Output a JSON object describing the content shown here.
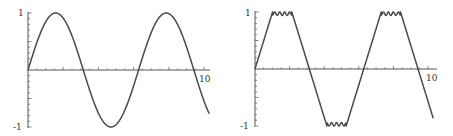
{
  "chart_data": [
    {
      "type": "line",
      "title": "",
      "xlabel": "",
      "ylabel": "",
      "function": "sin(x)",
      "x_range": [
        0,
        10.3
      ],
      "ylim": [
        -1,
        1
      ],
      "x_tick_labels": [
        "10"
      ],
      "y_tick_labels": [
        "1",
        "-1"
      ],
      "grid": false,
      "series": [
        {
          "name": "sin(x)",
          "x": [
            0,
            0.5,
            1,
            1.57,
            2,
            2.5,
            3,
            3.14,
            3.5,
            4,
            4.71,
            5,
            5.5,
            6,
            6.28,
            6.5,
            7,
            7.85,
            8.5,
            9,
            9.42,
            10,
            10.3
          ],
          "y": [
            0,
            0.48,
            0.84,
            1,
            0.91,
            0.6,
            0.14,
            0,
            -0.35,
            -0.76,
            -1,
            -0.96,
            -0.71,
            -0.28,
            0,
            0.22,
            0.66,
            1,
            0.8,
            0.41,
            0,
            -0.54,
            -0.77
          ]
        }
      ]
    },
    {
      "type": "line",
      "title": "",
      "xlabel": "",
      "ylabel": "",
      "function": "clipped triangle-like wave with ripple (Fourier approximation)",
      "x_range": [
        0,
        10.3
      ],
      "ylim": [
        -1,
        1
      ],
      "x_tick_labels": [
        "10"
      ],
      "y_tick_labels": [
        "1",
        "-1"
      ],
      "grid": false,
      "series": [
        {
          "name": "rippled trapezoid wave",
          "x": [
            0,
            0.8,
            1.0,
            2.2,
            2.4,
            3.14,
            3.9,
            4.1,
            5.3,
            5.5,
            6.28,
            7.1,
            7.3,
            8.5,
            8.7,
            9.42,
            10.3
          ],
          "y": [
            0,
            0.92,
            1,
            1,
            0.92,
            0,
            -0.92,
            -1,
            -1,
            -0.92,
            0,
            0.92,
            1,
            1,
            0.92,
            0,
            -1.35
          ]
        }
      ]
    }
  ],
  "panels": [
    {
      "x_label_max": "10",
      "y_label_top": "1",
      "y_label_bottom": "-1"
    },
    {
      "x_label_max": "10",
      "y_label_top": "1",
      "y_label_bottom": "-1"
    }
  ],
  "colors": {
    "curve": "#4a4a4a",
    "axis": "#555555",
    "background": "#ffffff"
  }
}
